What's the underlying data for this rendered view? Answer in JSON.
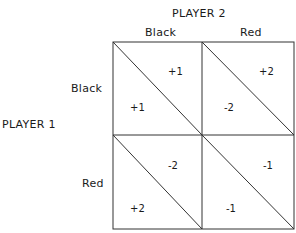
{
  "player2": {
    "label": "PLAYER 2",
    "columns": [
      "Black",
      "Red"
    ]
  },
  "player1": {
    "label": "PLAYER 1",
    "rows": [
      "Black",
      "Red"
    ]
  },
  "cells": [
    {
      "row": "Black",
      "col": "Black",
      "upper_right": "+1",
      "lower_left": "+1"
    },
    {
      "row": "Black",
      "col": "Red",
      "upper_right": "+2",
      "lower_left": "-2"
    },
    {
      "row": "Red",
      "col": "Black",
      "upper_right": "-2",
      "lower_left": "+2"
    },
    {
      "row": "Red",
      "col": "Red",
      "upper_right": "-1",
      "lower_left": "-1"
    }
  ],
  "colors": {
    "line": "#333333",
    "text": "#1a1a1a",
    "background": "#ffffff"
  }
}
